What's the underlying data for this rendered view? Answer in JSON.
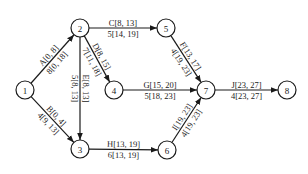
{
  "diagram": {
    "type": "activity-on-arrow network",
    "nodes": [
      {
        "id": "1",
        "label": "1",
        "x": 25,
        "y": 90
      },
      {
        "id": "2",
        "label": "2",
        "x": 80,
        "y": 28
      },
      {
        "id": "3",
        "label": "3",
        "x": 80,
        "y": 149
      },
      {
        "id": "4",
        "label": "4",
        "x": 114,
        "y": 90
      },
      {
        "id": "5",
        "label": "5",
        "x": 166,
        "y": 28
      },
      {
        "id": "6",
        "label": "6",
        "x": 167,
        "y": 150
      },
      {
        "id": "7",
        "label": "7",
        "x": 206,
        "y": 90
      },
      {
        "id": "8",
        "label": "8",
        "x": 287,
        "y": 90
      }
    ],
    "edges": [
      {
        "from": "1",
        "to": "2",
        "top": "A[0, 8]",
        "bottom": "8[0, 18]"
      },
      {
        "from": "1",
        "to": "3",
        "top": "B[0, 4]",
        "bottom": "4[9, 13]"
      },
      {
        "from": "2",
        "to": "5",
        "top": "C[8, 13]",
        "bottom": "5[14, 19]"
      },
      {
        "from": "2",
        "to": "4",
        "top": "D[8, 15]",
        "bottom": "7[11, 18]"
      },
      {
        "from": "2",
        "to": "3",
        "top": "E[8, 13]",
        "bottom": "5[8, 13]"
      },
      {
        "from": "5",
        "to": "7",
        "top": "F[13, 17]",
        "bottom": "4[19, 23]"
      },
      {
        "from": "4",
        "to": "7",
        "top": "G[15, 20]",
        "bottom": "5[18, 23]"
      },
      {
        "from": "3",
        "to": "6",
        "top": "H[13, 19]",
        "bottom": "6[13, 19]"
      },
      {
        "from": "6",
        "to": "7",
        "top": "I[19, 23]",
        "bottom": "4[19, 23]"
      },
      {
        "from": "7",
        "to": "8",
        "top": "J[23, 27]",
        "bottom": "4[23, 27]"
      }
    ]
  }
}
